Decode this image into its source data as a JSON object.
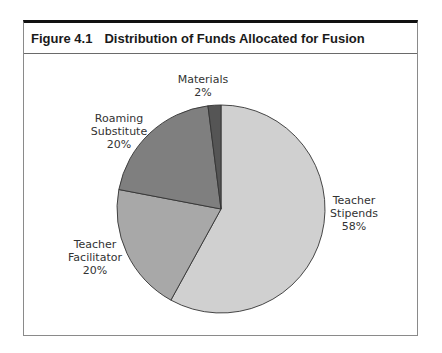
{
  "figure": {
    "number": "Figure 4.1",
    "title": "Distribution of Funds Allocated for Fusion"
  },
  "chart_data": {
    "type": "pie",
    "title": "Distribution of Funds Allocated for Fusion",
    "categories": [
      "Teacher Stipends",
      "Teacher Facilitator",
      "Roaming Substitute",
      "Materials"
    ],
    "values": [
      58,
      20,
      20,
      2
    ],
    "unit": "%",
    "colors": [
      "#d0d0d0",
      "#a8a8a8",
      "#7f7f7f",
      "#555555"
    ],
    "start_angle": "12 o'clock, clockwise",
    "labels": [
      {
        "line1": "Teacher",
        "line2": "Stipends",
        "pct": "58%"
      },
      {
        "line1": "Teacher",
        "line2": "Facilitator",
        "pct": "20%"
      },
      {
        "line1": "Roaming",
        "line2": "Substitute",
        "pct": "20%"
      },
      {
        "line1": "Materials",
        "line2": "",
        "pct": "2%"
      }
    ],
    "legend": "none (direct labels)"
  }
}
